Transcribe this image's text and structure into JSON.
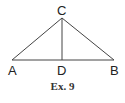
{
  "diagram": {
    "points": {
      "A": {
        "label": "A",
        "x": 12,
        "y": 60
      },
      "B": {
        "label": "B",
        "x": 114,
        "y": 60
      },
      "C": {
        "label": "C",
        "x": 62,
        "y": 18
      },
      "D": {
        "label": "D",
        "x": 62,
        "y": 60
      }
    },
    "segments": [
      "AC",
      "CB",
      "AB",
      "CD"
    ],
    "caption": "Ex. 9",
    "line_color": "#444444"
  }
}
